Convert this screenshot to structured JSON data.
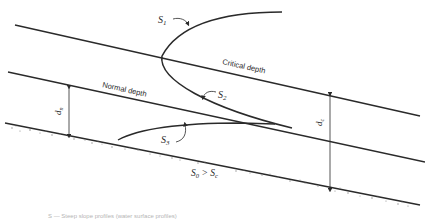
{
  "figure": {
    "labels": {
      "s1": "S",
      "s1_sub": "1",
      "s2": "S",
      "s2_sub": "2",
      "s3": "S",
      "s3_sub": "3",
      "critical_depth": "Critical depth",
      "normal_depth": "Normal depth",
      "dn": "d",
      "dn_sub": "n",
      "dc": "d",
      "dc_sub": "c",
      "slope_condition": "S",
      "slope_condition_sub0": "0",
      "slope_condition_gt": " > S",
      "slope_condition_subc": "c"
    },
    "caption": "S — Steep slope profiles (water surface profiles)",
    "colors": {
      "line": "#2a2a2a",
      "ground_speckle": "#8a8a8a",
      "caption": "#b5b5b5"
    }
  }
}
